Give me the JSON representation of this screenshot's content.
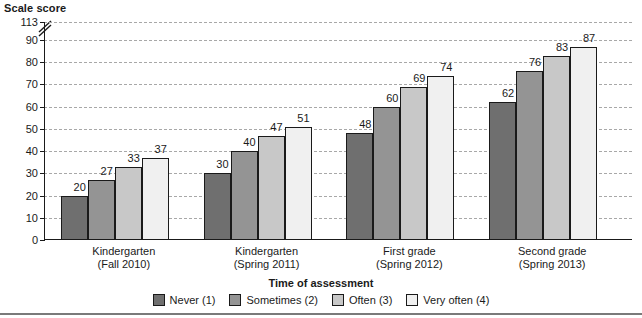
{
  "axes": {
    "y_title": "Scale score",
    "x_title": "Time of assessment",
    "y_ticks": [
      "0",
      "10",
      "20",
      "30",
      "40",
      "50",
      "60",
      "70",
      "80",
      "90",
      "113"
    ],
    "y_break_after": "90",
    "y_break_icon": "axis-break-icon"
  },
  "legend": {
    "items": [
      {
        "label": "Never (1)",
        "color": "#6f6f6f",
        "swatch_name": "legend-swatch-never"
      },
      {
        "label": "Sometimes (2)",
        "color": "#949494",
        "swatch_name": "legend-swatch-sometimes"
      },
      {
        "label": "Often (3)",
        "color": "#c8c8c8",
        "swatch_name": "legend-swatch-often"
      },
      {
        "label": "Very often (4)",
        "color": "#f0f0f0",
        "swatch_name": "legend-swatch-very-often"
      }
    ]
  },
  "groups": [
    {
      "line1": "Kindergarten",
      "line2": "(Fall 2010)"
    },
    {
      "line1": "Kindergarten",
      "line2": "(Spring 2011)"
    },
    {
      "line1": "First grade",
      "line2": "(Spring 2012)"
    },
    {
      "line1": "Second grade",
      "line2": "(Spring 2013)"
    }
  ],
  "chart_data": {
    "type": "bar",
    "title": "",
    "xlabel": "Time of assessment",
    "ylabel": "Scale score",
    "ylim": [
      0,
      113
    ],
    "y_axis_break": {
      "from": 90,
      "to": 113
    },
    "grid": true,
    "legend_position": "bottom",
    "categories": [
      "Kindergarten (Fall 2010)",
      "Kindergarten (Spring 2011)",
      "First grade (Spring 2012)",
      "Second grade (Spring 2013)"
    ],
    "series": [
      {
        "name": "Never (1)",
        "color": "#6f6f6f",
        "values": [
          20,
          30,
          48,
          62
        ]
      },
      {
        "name": "Sometimes (2)",
        "color": "#949494",
        "values": [
          27,
          40,
          60,
          76
        ]
      },
      {
        "name": "Often (3)",
        "color": "#c8c8c8",
        "values": [
          33,
          47,
          69,
          83
        ]
      },
      {
        "name": "Very often (4)",
        "color": "#f0f0f0",
        "values": [
          37,
          51,
          74,
          87
        ]
      }
    ],
    "tick_values": [
      0,
      10,
      20,
      30,
      40,
      50,
      60,
      70,
      80,
      90,
      113
    ]
  }
}
